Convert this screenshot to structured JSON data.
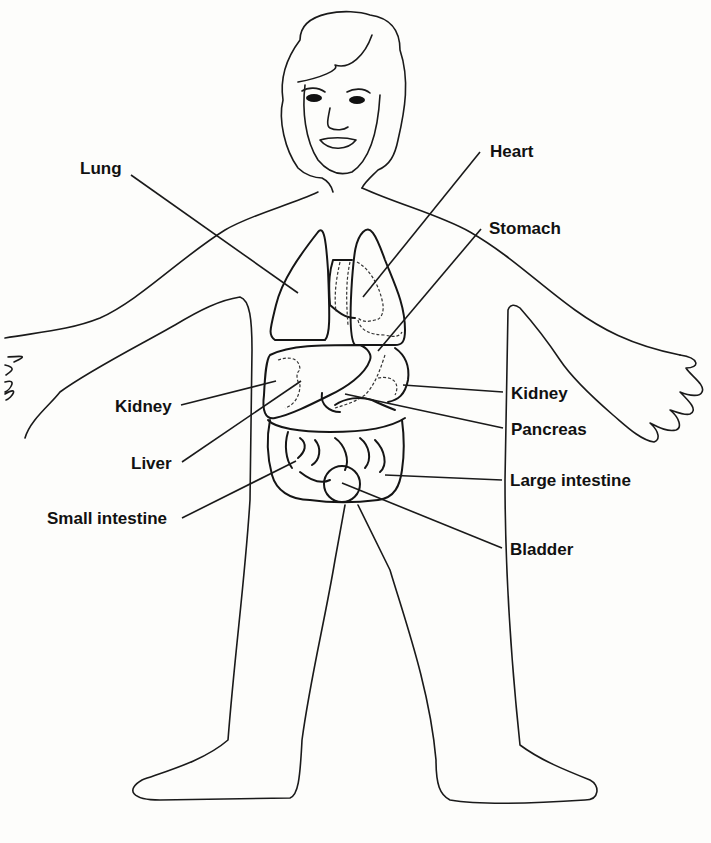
{
  "diagram": {
    "labels": [
      {
        "id": "lung",
        "text": "Lung",
        "x": 80,
        "y": 169
      },
      {
        "id": "heart",
        "text": "Heart",
        "x": 490,
        "y": 144
      },
      {
        "id": "stomach",
        "text": "Stomach",
        "x": 489,
        "y": 221
      },
      {
        "id": "kidney-left",
        "text": "Kidney",
        "x": 115,
        "y": 399
      },
      {
        "id": "kidney-right",
        "text": "Kidney",
        "x": 511,
        "y": 386
      },
      {
        "id": "pancreas",
        "text": "Pancreas",
        "x": 511,
        "y": 422
      },
      {
        "id": "liver",
        "text": "Liver",
        "x": 131,
        "y": 456
      },
      {
        "id": "large-intestine",
        "text": "Large intestine",
        "x": 510,
        "y": 473
      },
      {
        "id": "small-intestine",
        "text": "Small intestine",
        "x": 47,
        "y": 511
      },
      {
        "id": "bladder",
        "text": "Bladder",
        "x": 510,
        "y": 542
      }
    ]
  }
}
